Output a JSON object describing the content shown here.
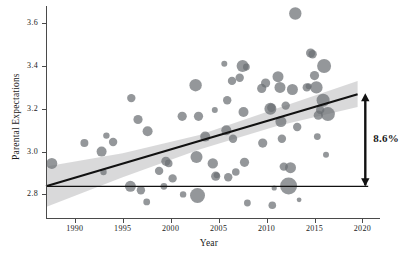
{
  "chart_data": {
    "type": "scatter",
    "title": "",
    "xlabel": "Year",
    "ylabel": "Parental Expectations",
    "xlim": [
      1987,
      2021
    ],
    "ylim": [
      2.69,
      3.68
    ],
    "xticks": [
      1990,
      1995,
      2000,
      2005,
      2010,
      2015,
      2020
    ],
    "yticks": [
      2.8,
      3.0,
      3.2,
      3.4,
      3.6
    ],
    "ytick_labels": [
      "2.8",
      "3.0",
      "3.2",
      "3.4",
      "3.6"
    ],
    "xtick_labels": [
      "1990",
      "1995",
      "2000",
      "2005",
      "2010",
      "2015",
      "2020"
    ],
    "grid": false,
    "legend": "none",
    "marker_color": "#6b6f73",
    "marker_opacity": 0.72,
    "size_encodes": "sample weight",
    "points": [
      {
        "x": 1987.6,
        "y": 2.945,
        "s": 5.5
      },
      {
        "x": 1991.0,
        "y": 3.04,
        "s": 4.0
      },
      {
        "x": 1992.8,
        "y": 3.0,
        "s": 5.0
      },
      {
        "x": 1993.0,
        "y": 2.905,
        "s": 3.2
      },
      {
        "x": 1993.3,
        "y": 3.075,
        "s": 3.2
      },
      {
        "x": 1994.0,
        "y": 3.045,
        "s": 4.2
      },
      {
        "x": 1995.9,
        "y": 3.25,
        "s": 4.2
      },
      {
        "x": 1995.8,
        "y": 2.838,
        "s": 5.5
      },
      {
        "x": 1996.6,
        "y": 3.15,
        "s": 4.6
      },
      {
        "x": 1996.9,
        "y": 2.82,
        "s": 4.2
      },
      {
        "x": 1997.6,
        "y": 3.095,
        "s": 5.0
      },
      {
        "x": 1997.5,
        "y": 2.765,
        "s": 3.4
      },
      {
        "x": 1998.8,
        "y": 2.91,
        "s": 4.2
      },
      {
        "x": 1999.3,
        "y": 2.838,
        "s": 3.4
      },
      {
        "x": 1999.5,
        "y": 2.955,
        "s": 4.6
      },
      {
        "x": 1999.8,
        "y": 2.945,
        "s": 3.8
      },
      {
        "x": 2000.2,
        "y": 2.875,
        "s": 4.2
      },
      {
        "x": 2001.2,
        "y": 3.165,
        "s": 4.6
      },
      {
        "x": 2001.3,
        "y": 2.8,
        "s": 3.2
      },
      {
        "x": 2002.6,
        "y": 3.31,
        "s": 6.2
      },
      {
        "x": 2002.7,
        "y": 2.975,
        "s": 6.0
      },
      {
        "x": 2002.9,
        "y": 3.165,
        "s": 4.6
      },
      {
        "x": 2002.8,
        "y": 2.795,
        "s": 7.5
      },
      {
        "x": 2003.6,
        "y": 3.07,
        "s": 5.0
      },
      {
        "x": 2004.4,
        "y": 2.945,
        "s": 5.2
      },
      {
        "x": 2004.7,
        "y": 2.885,
        "s": 4.6
      },
      {
        "x": 2004.6,
        "y": 3.195,
        "s": 3.0
      },
      {
        "x": 2004.8,
        "y": 2.89,
        "s": 3.0
      },
      {
        "x": 2005.6,
        "y": 3.41,
        "s": 3.0
      },
      {
        "x": 2005.8,
        "y": 3.1,
        "s": 5.0
      },
      {
        "x": 2005.9,
        "y": 3.24,
        "s": 4.2
      },
      {
        "x": 2006.0,
        "y": 2.88,
        "s": 4.2
      },
      {
        "x": 2006.4,
        "y": 3.33,
        "s": 4.2
      },
      {
        "x": 2006.5,
        "y": 3.06,
        "s": 4.2
      },
      {
        "x": 2006.8,
        "y": 2.905,
        "s": 3.8
      },
      {
        "x": 2007.2,
        "y": 3.345,
        "s": 4.2
      },
      {
        "x": 2007.5,
        "y": 3.4,
        "s": 6.0
      },
      {
        "x": 2007.6,
        "y": 3.185,
        "s": 5.0
      },
      {
        "x": 2007.7,
        "y": 2.95,
        "s": 4.6
      },
      {
        "x": 2007.9,
        "y": 3.395,
        "s": 3.4
      },
      {
        "x": 2008.0,
        "y": 2.76,
        "s": 3.4
      },
      {
        "x": 2009.5,
        "y": 3.295,
        "s": 4.6
      },
      {
        "x": 2009.6,
        "y": 3.04,
        "s": 4.6
      },
      {
        "x": 2009.9,
        "y": 3.32,
        "s": 4.6
      },
      {
        "x": 2010.4,
        "y": 3.2,
        "s": 6.0
      },
      {
        "x": 2010.5,
        "y": 3.205,
        "s": 4.2
      },
      {
        "x": 2010.6,
        "y": 2.75,
        "s": 3.8
      },
      {
        "x": 2010.8,
        "y": 2.83,
        "s": 2.6
      },
      {
        "x": 2011.2,
        "y": 3.35,
        "s": 5.5
      },
      {
        "x": 2011.4,
        "y": 3.3,
        "s": 5.5
      },
      {
        "x": 2011.5,
        "y": 3.14,
        "s": 5.5
      },
      {
        "x": 2011.6,
        "y": 3.06,
        "s": 4.2
      },
      {
        "x": 2011.8,
        "y": 2.93,
        "s": 4.2
      },
      {
        "x": 2012.0,
        "y": 3.215,
        "s": 4.2
      },
      {
        "x": 2012.3,
        "y": 2.84,
        "s": 8.5
      },
      {
        "x": 2012.5,
        "y": 2.925,
        "s": 5.5
      },
      {
        "x": 2012.7,
        "y": 3.29,
        "s": 5.5
      },
      {
        "x": 2013.0,
        "y": 3.645,
        "s": 6.2
      },
      {
        "x": 2013.2,
        "y": 3.115,
        "s": 4.2
      },
      {
        "x": 2013.4,
        "y": 2.775,
        "s": 2.4
      },
      {
        "x": 2014.2,
        "y": 3.3,
        "s": 4.2
      },
      {
        "x": 2014.4,
        "y": 3.305,
        "s": 3.0
      },
      {
        "x": 2014.6,
        "y": 3.46,
        "s": 4.6
      },
      {
        "x": 2014.8,
        "y": 3.455,
        "s": 4.2
      },
      {
        "x": 2015.0,
        "y": 3.355,
        "s": 4.6
      },
      {
        "x": 2015.2,
        "y": 3.3,
        "s": 6.2
      },
      {
        "x": 2015.4,
        "y": 3.17,
        "s": 4.6
      },
      {
        "x": 2015.6,
        "y": 3.195,
        "s": 4.2
      },
      {
        "x": 2015.3,
        "y": 3.07,
        "s": 3.4
      },
      {
        "x": 2016.0,
        "y": 3.4,
        "s": 7.0
      },
      {
        "x": 2015.9,
        "y": 3.24,
        "s": 6.5
      },
      {
        "x": 2016.4,
        "y": 3.175,
        "s": 7.0
      },
      {
        "x": 2016.2,
        "y": 2.985,
        "s": 3.0
      }
    ],
    "regression": {
      "label": "linear fit",
      "x_start": 1987.0,
      "y_start": 2.838,
      "x_end": 2019.5,
      "y_end": 3.268,
      "color": "#111111"
    },
    "confidence_band": {
      "color": "#b9babb",
      "opacity": 0.55,
      "lower": [
        {
          "x": 1987.0,
          "y": 2.742
        },
        {
          "x": 1995.0,
          "y": 2.88
        },
        {
          "x": 2003.0,
          "y": 3.01
        },
        {
          "x": 2011.0,
          "y": 3.118
        },
        {
          "x": 2019.5,
          "y": 3.208
        }
      ],
      "upper": [
        {
          "x": 1987.0,
          "y": 2.93
        },
        {
          "x": 1995.0,
          "y": 2.992
        },
        {
          "x": 2003.0,
          "y": 3.078
        },
        {
          "x": 2011.0,
          "y": 3.2
        },
        {
          "x": 2019.5,
          "y": 3.33
        }
      ]
    },
    "reference_line": {
      "y": 2.838,
      "x_start": 1987.0,
      "x_end": 2020.6,
      "color": "#111111"
    },
    "annotation": {
      "text": "8.6%",
      "x": 2020.3,
      "y_bottom": 2.838,
      "y_top": 3.272,
      "arrow": "double-headed-vertical"
    }
  }
}
